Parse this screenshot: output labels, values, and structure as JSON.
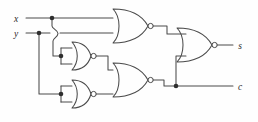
{
  "diagram": {
    "kind": "logic-circuit-schematic",
    "background_color": "#fefefe",
    "wire_color": "#4a4a4a",
    "junction_color": "#2e2e2e",
    "label_color": "#2b2b2b"
  },
  "inputs": [
    {
      "id": "x",
      "label": "x",
      "label_x": 16,
      "label_y": 22,
      "wire_y": 18
    },
    {
      "id": "y",
      "label": "y",
      "label_x": 16,
      "label_y": 37,
      "wire_y": 33
    }
  ],
  "outputs": [
    {
      "id": "s",
      "label": "s",
      "label_x": 239,
      "label_y": 48,
      "wire_y": 45
    },
    {
      "id": "c",
      "label": "c",
      "label_x": 239,
      "label_y": 89,
      "wire_y": 86
    }
  ],
  "gates": [
    {
      "id": "nor-top",
      "type": "NOR",
      "inputs": 2,
      "cx": 130,
      "cy": 26,
      "w": 34,
      "h": 32,
      "role": "x NOR y (top)"
    },
    {
      "id": "nor-mid-inverter",
      "type": "NOR",
      "inputs": 2,
      "cx": 72,
      "cy": 56,
      "w": 34,
      "h": 28,
      "role": "inverter on x"
    },
    {
      "id": "nor-bot-inverter",
      "type": "NOR",
      "inputs": 2,
      "cx": 72,
      "cy": 94,
      "w": 34,
      "h": 28,
      "role": "inverter on y"
    },
    {
      "id": "nor-carry",
      "type": "NOR",
      "inputs": 2,
      "cx": 130,
      "cy": 80,
      "w": 34,
      "h": 32,
      "role": "carry output c"
    },
    {
      "id": "nor-sum",
      "type": "NOR",
      "inputs": 2,
      "cx": 192,
      "cy": 45,
      "w": 34,
      "h": 34,
      "role": "sum output s"
    }
  ],
  "junctions": [
    {
      "id": "j-x-tap",
      "x": 52,
      "y": 18
    },
    {
      "id": "j-y-tap",
      "x": 39,
      "y": 33
    },
    {
      "id": "j-mid-inv-tie",
      "x": 61,
      "y": 56
    },
    {
      "id": "j-bot-inv-tie",
      "x": 61,
      "y": 94
    },
    {
      "id": "j-carry-tap",
      "x": 176,
      "y": 86
    }
  ],
  "bubbles": [
    {
      "id": "bub-top",
      "x": 150,
      "y": 26
    },
    {
      "id": "bub-mid",
      "x": 92,
      "y": 56
    },
    {
      "id": "bub-bot",
      "x": 92,
      "y": 94
    },
    {
      "id": "bub-carry",
      "x": 150,
      "y": 86
    },
    {
      "id": "bub-sum",
      "x": 214,
      "y": 45
    }
  ],
  "wire_hop": {
    "id": "hop-xy-cross",
    "x": 56,
    "y_from": 18,
    "y_to": 33
  }
}
